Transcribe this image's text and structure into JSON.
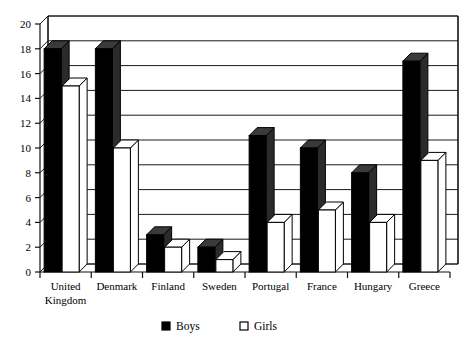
{
  "chart_data": {
    "type": "bar",
    "title": "",
    "subtitle": "",
    "xlabel": "",
    "ylabel": "",
    "ylim": [
      0,
      20
    ],
    "ytick_step": 2,
    "yticks": [
      "0",
      "2",
      "4",
      "6",
      "8",
      "10",
      "12",
      "14",
      "16",
      "18",
      "20"
    ],
    "grid": true,
    "grid_axis": "y",
    "legend_position": "bottom",
    "style": "3d-column",
    "categories": [
      "United Kingdom",
      "Denmark",
      "Finland",
      "Sweden",
      "Portugal",
      "France",
      "Hungary",
      "Greece"
    ],
    "category_lines": [
      [
        "United",
        "Kingdom"
      ],
      [
        "Denmark"
      ],
      [
        "Finland"
      ],
      [
        "Sweden"
      ],
      [
        "Portugal"
      ],
      [
        "France"
      ],
      [
        "Hungary"
      ],
      [
        "Greece"
      ]
    ],
    "series": [
      {
        "name": "Boys",
        "color": "#000000",
        "values": [
          18,
          18,
          3,
          2,
          11,
          10,
          8,
          17
        ]
      },
      {
        "name": "Girls",
        "color": "#ffffff",
        "values": [
          15,
          10,
          2,
          1,
          4,
          5,
          4,
          9
        ]
      }
    ]
  },
  "legend": {
    "items": [
      {
        "label": "Boys",
        "swatch": "filled-square-icon"
      },
      {
        "label": "Girls",
        "swatch": "open-square-icon"
      }
    ]
  },
  "axes": {
    "y_axis_name": "value-axis",
    "x_axis_name": "category-axis"
  }
}
